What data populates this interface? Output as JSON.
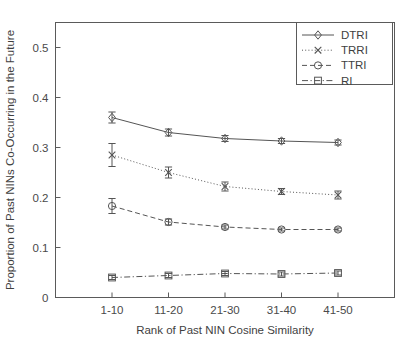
{
  "chart_data": {
    "type": "line",
    "title": "",
    "xlabel": "Rank of Past NIN Cosine Similarity",
    "ylabel": "Proportion of Past NINs Co-Occurring in the Future",
    "categories": [
      "1-10",
      "11-20",
      "21-30",
      "31-40",
      "41-50"
    ],
    "ylim": [
      0,
      0.55
    ],
    "yticks": [
      0,
      0.1,
      0.2,
      0.3,
      0.4,
      0.5
    ],
    "ytick_labels": [
      "0",
      "0.1",
      "0.2",
      "0.3",
      "0.4",
      "0.5"
    ],
    "grid": false,
    "legend_position": "top-right",
    "series": [
      {
        "name": "DTRI",
        "marker": "diamond",
        "linestyle": "solid",
        "color": "#555555",
        "values": [
          0.36,
          0.33,
          0.318,
          0.313,
          0.31
        ],
        "err_low": [
          0.011,
          0.007,
          0.006,
          0.005,
          0.005
        ],
        "err_high": [
          0.011,
          0.007,
          0.006,
          0.005,
          0.005
        ]
      },
      {
        "name": "TRRI",
        "marker": "cross",
        "linestyle": "dotted",
        "color": "#555555",
        "values": [
          0.285,
          0.25,
          0.222,
          0.212,
          0.205
        ],
        "err_low": [
          0.023,
          0.011,
          0.009,
          0.006,
          0.008
        ],
        "err_high": [
          0.023,
          0.011,
          0.009,
          0.006,
          0.008
        ]
      },
      {
        "name": "TTRI",
        "marker": "circle",
        "linestyle": "dashed",
        "color": "#555555",
        "values": [
          0.183,
          0.151,
          0.141,
          0.136,
          0.136
        ],
        "err_low": [
          0.015,
          0.006,
          0.004,
          0.003,
          0.003
        ],
        "err_high": [
          0.015,
          0.006,
          0.004,
          0.003,
          0.003
        ]
      },
      {
        "name": "RI",
        "marker": "square",
        "linestyle": "dashdot",
        "color": "#555555",
        "values": [
          0.04,
          0.044,
          0.048,
          0.047,
          0.049
        ],
        "err_low": [
          0.004,
          0.004,
          0.004,
          0.004,
          0.004
        ],
        "err_high": [
          0.004,
          0.004,
          0.004,
          0.004,
          0.004
        ]
      }
    ]
  },
  "legend": {
    "entries": [
      "DTRI",
      "TRRI",
      "TTRI",
      "RI"
    ]
  },
  "axes": {
    "x_tick_labels": [
      "1-10",
      "11-20",
      "21-30",
      "31-40",
      "41-50"
    ],
    "y_tick_labels": [
      "0",
      "0.1",
      "0.2",
      "0.3",
      "0.4",
      "0.5"
    ],
    "x_title": "Rank of Past NIN Cosine Similarity",
    "y_title": "Proportion of Past NINs Co-Occurring in the Future"
  }
}
